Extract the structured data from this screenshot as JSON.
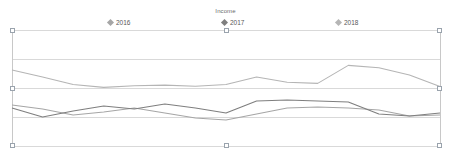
{
  "chart": {
    "title": "Income",
    "title_color": "#6b6b6b",
    "frame_color": "#c8c8c8",
    "grid_color": "#d9d9d9",
    "handle_color": "#9aa3ad"
  },
  "legend": [
    {
      "label": "2016",
      "color": "#a6a6a6",
      "marker": "diamond-marker",
      "x": 108
    },
    {
      "label": "2017",
      "color": "#7f7f7f",
      "marker": "diamond-marker",
      "x": 222
    },
    {
      "label": "2018",
      "color": "#b5b5b5",
      "marker": "diamond-marker",
      "x": 336
    }
  ],
  "handles": [
    {
      "name": "handle-top-left",
      "x": 10,
      "y": 28
    },
    {
      "name": "handle-top-center",
      "x": 224,
      "y": 28
    },
    {
      "name": "handle-top-right",
      "x": 437,
      "y": 28
    },
    {
      "name": "handle-middle-left",
      "x": 10,
      "y": 86
    },
    {
      "name": "handle-middle-right",
      "x": 437,
      "y": 86
    },
    {
      "name": "handle-bottom-left",
      "x": 10,
      "y": 143
    },
    {
      "name": "handle-bottom-center",
      "x": 224,
      "y": 143
    },
    {
      "name": "handle-bottom-right",
      "x": 437,
      "y": 143
    }
  ],
  "chart_data": {
    "type": "line",
    "title": "Income",
    "xlabel": "",
    "ylabel": "",
    "grid": true,
    "legend_position": "top",
    "axis_ticks_visible": false,
    "plot_area_px": {
      "x0": 12,
      "y0": 30,
      "x1": 440,
      "y1": 146
    },
    "ylim": [
      0,
      4
    ],
    "gridline_values": [
      4,
      3,
      2,
      1,
      0
    ],
    "gridline_y_px": [
      30,
      59,
      88,
      117,
      146
    ],
    "categories": [
      "1",
      "2",
      "3",
      "4",
      "5",
      "6",
      "7",
      "8",
      "9",
      "10",
      "11",
      "12",
      "13",
      "14",
      "15"
    ],
    "series": [
      {
        "name": "2016",
        "color": "#a6a6a6",
        "values": [
          1.32,
          1.2,
          1.03,
          1.12,
          1.22,
          1.1,
          0.96,
          0.9,
          1.08,
          1.22,
          1.25,
          1.22,
          1.18,
          1.02,
          1.05
        ],
        "y_px": [
          105,
          109,
          115,
          112,
          108,
          113,
          118,
          120,
          114,
          108,
          107,
          108,
          110,
          116,
          115
        ]
      },
      {
        "name": "2017",
        "color": "#7f7f7f",
        "values": [
          1.24,
          1.0,
          1.15,
          1.28,
          1.2,
          1.32,
          1.22,
          1.1,
          1.38,
          1.4,
          1.38,
          1.36,
          1.12,
          1.05,
          1.12
        ],
        "y_px": [
          108,
          117,
          111,
          106,
          109,
          104,
          108,
          113,
          101,
          100,
          101,
          102,
          114,
          116,
          113
        ]
      },
      {
        "name": "2018",
        "color": "#b5b5b5",
        "values": [
          2.62,
          2.38,
          2.12,
          2.02,
          2.08,
          2.1,
          2.06,
          2.12,
          2.38,
          2.2,
          2.16,
          2.78,
          2.7,
          2.45,
          2.05
        ]
      }
    ]
  }
}
